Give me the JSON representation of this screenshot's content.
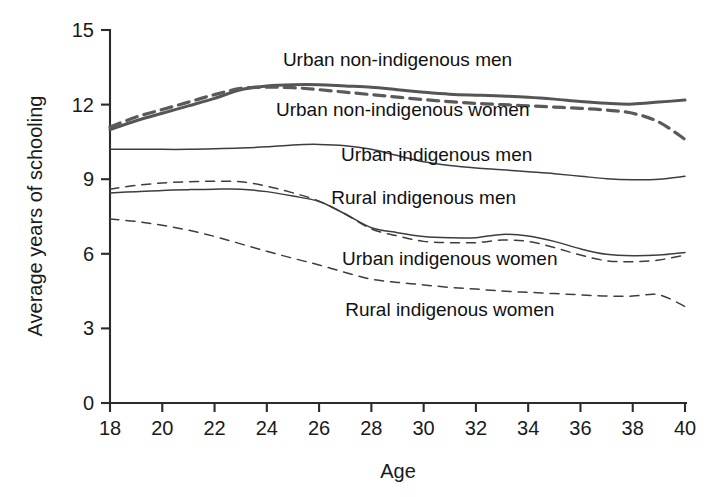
{
  "chart_data": {
    "type": "line",
    "title": "",
    "xlabel": "Age",
    "ylabel": "Average years of schooling",
    "xlim": [
      18,
      40
    ],
    "ylim": [
      0,
      15
    ],
    "grid": false,
    "legend_position": "inline-annotations",
    "xticks": [
      18,
      20,
      22,
      24,
      26,
      28,
      30,
      32,
      34,
      36,
      38,
      40
    ],
    "yticks": [
      0,
      3,
      6,
      9,
      12,
      15
    ],
    "x": [
      18,
      19,
      20,
      21,
      22,
      23,
      24,
      25,
      26,
      27,
      28,
      29,
      30,
      31,
      32,
      33,
      34,
      35,
      36,
      37,
      38,
      39,
      40
    ],
    "series": [
      {
        "name": "Urban non-indigenous men",
        "style": "solid-bold",
        "label_x": 29.0,
        "label_y": 13.55,
        "values": [
          11.0,
          11.35,
          11.65,
          11.95,
          12.25,
          12.6,
          12.75,
          12.8,
          12.8,
          12.75,
          12.7,
          12.6,
          12.5,
          12.42,
          12.38,
          12.35,
          12.3,
          12.22,
          12.12,
          12.05,
          12.02,
          12.1,
          12.18
        ]
      },
      {
        "name": "Urban non-indigenous women",
        "style": "dashed-bold",
        "label_x": 29.2,
        "label_y": 11.55,
        "values": [
          11.1,
          11.5,
          11.8,
          12.1,
          12.4,
          12.65,
          12.7,
          12.68,
          12.6,
          12.5,
          12.4,
          12.3,
          12.2,
          12.12,
          12.05,
          12.0,
          11.95,
          11.9,
          11.85,
          11.78,
          11.65,
          11.3,
          10.6
        ]
      },
      {
        "name": "Urban indigenous men",
        "style": "solid-thin",
        "label_x": 30.5,
        "label_y": 9.75,
        "values": [
          10.2,
          10.2,
          10.2,
          10.2,
          10.22,
          10.25,
          10.3,
          10.38,
          10.4,
          10.35,
          10.2,
          9.95,
          9.7,
          9.55,
          9.45,
          9.38,
          9.3,
          9.22,
          9.12,
          9.02,
          8.98,
          9.0,
          9.12
        ]
      },
      {
        "name": "Rural indigenous men",
        "style": "solid-thin",
        "label_x": 30.0,
        "label_y": 8.0,
        "values": [
          8.45,
          8.5,
          8.55,
          8.58,
          8.6,
          8.6,
          8.5,
          8.32,
          8.1,
          7.6,
          7.05,
          6.85,
          6.7,
          6.65,
          6.65,
          6.78,
          6.72,
          6.5,
          6.2,
          5.98,
          5.92,
          5.95,
          6.05
        ]
      },
      {
        "name": "Urban indigenous women",
        "style": "dashed",
        "label_x": 31.0,
        "label_y": 5.55,
        "values": [
          8.6,
          8.75,
          8.85,
          8.9,
          8.92,
          8.9,
          8.72,
          8.45,
          8.12,
          7.6,
          7.0,
          6.72,
          6.5,
          6.45,
          6.45,
          6.55,
          6.5,
          6.25,
          5.95,
          5.72,
          5.68,
          5.75,
          5.95
        ]
      },
      {
        "name": "Rural indigenous women",
        "style": "dashed",
        "label_x": 31.0,
        "label_y": 3.5,
        "values": [
          7.4,
          7.3,
          7.15,
          6.95,
          6.7,
          6.4,
          6.1,
          5.82,
          5.55,
          5.25,
          4.98,
          4.85,
          4.75,
          4.65,
          4.58,
          4.5,
          4.45,
          4.4,
          4.35,
          4.3,
          4.3,
          4.35,
          3.88
        ]
      }
    ]
  }
}
